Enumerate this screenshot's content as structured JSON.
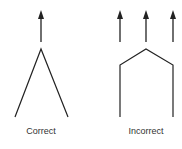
{
  "panels": [
    {
      "id": "correct",
      "label": "Correct",
      "arrows": 1,
      "shape": "inverted-v"
    },
    {
      "id": "incorrect",
      "label": "Incorrect",
      "arrows": 3,
      "shape": "house-outline"
    }
  ],
  "colors": {
    "stroke": "#222222",
    "text": "#333333",
    "background": "#ffffff"
  }
}
